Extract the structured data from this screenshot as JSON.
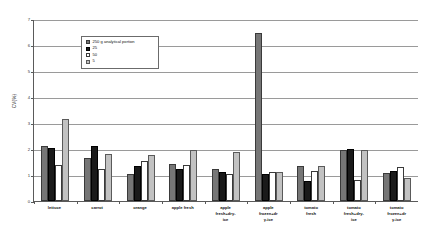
{
  "chart_data": {
    "type": "bar",
    "title": "",
    "xlabel": "",
    "ylabel": "CV(%)",
    "ylim": [
      0,
      7
    ],
    "yticks": [
      "0",
      "1",
      "2",
      "3",
      "4",
      "5",
      "6",
      "7"
    ],
    "grid": true,
    "legend_position": "top-left-inside",
    "categories": [
      "lettuce",
      "carrot",
      "orange",
      "apple fresh",
      "apple fresh+dry-ice",
      "apple frozen+dry-ice",
      "tomato fresh",
      "tomato fresh+dry-ice",
      "tomato frozen+dry-ice"
    ],
    "category_lines": [
      [
        "lettuce"
      ],
      [
        "carrot"
      ],
      [
        "orange"
      ],
      [
        "apple fresh"
      ],
      [
        "apple",
        "fresh+dry-",
        "ice"
      ],
      [
        "apple",
        "frozen+dr",
        "y-ice"
      ],
      [
        "tomato",
        "fresh"
      ],
      [
        "tomato",
        "fresh+dry-",
        "ice"
      ],
      [
        "tomato",
        "frozen+dr",
        "y-ice"
      ]
    ],
    "series": [
      {
        "name": "250 g analytical portion",
        "color": "#767676",
        "values": [
          2.1,
          1.65,
          1.05,
          1.43,
          1.22,
          6.45,
          1.34,
          1.97,
          1.08
        ]
      },
      {
        "name": "25",
        "color": "#1a1a1a",
        "values": [
          2.05,
          2.12,
          1.35,
          1.23,
          1.1,
          1.05,
          0.78,
          2.0,
          1.15
        ]
      },
      {
        "name": "50",
        "color": "#ffffff",
        "values": [
          1.4,
          1.25,
          1.55,
          1.4,
          1.02,
          1.1,
          1.15,
          0.8,
          1.29
        ]
      },
      {
        "name": "5",
        "color": "#c2c2c2",
        "values": [
          3.16,
          1.81,
          1.78,
          1.95,
          1.9,
          1.12,
          1.36,
          1.98,
          0.88
        ]
      }
    ]
  }
}
